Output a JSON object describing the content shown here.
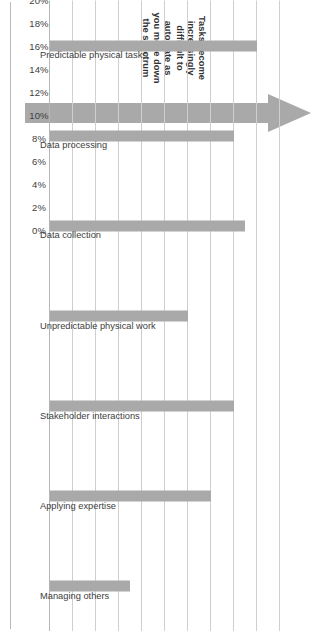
{
  "chart_data": {
    "type": "bar",
    "title": "",
    "subtitle": "",
    "xlabel": "",
    "ylabel": "",
    "orientation": "rotated-90-clockwise",
    "grid": true,
    "legend": null,
    "ylim": [
      0,
      20
    ],
    "y_tick_step": 2,
    "value_suffix": "%",
    "categories": [
      "Predictable physical tasks",
      "Data processing",
      "Data collection",
      "Unpredictable physical work",
      "Stakeholder interactions",
      "Applying expertise",
      "Managing others"
    ],
    "values": [
      18,
      16,
      17,
      12,
      16,
      14,
      7
    ],
    "tick_labels": [
      "0%",
      "2%",
      "4%",
      "6%",
      "8%",
      "10%",
      "12%",
      "14%",
      "16%",
      "18%",
      "20%"
    ],
    "tick_values": [
      0,
      2,
      4,
      6,
      8,
      10,
      12,
      14,
      16,
      18,
      20
    ],
    "annotations": [
      {
        "name": "spectrum-note",
        "lines": [
          "Tasks become",
          "increasingly",
          "difficult to",
          "automate as",
          "you move down",
          "the spectrum"
        ]
      }
    ],
    "colors": {
      "bar": "#a9a9a9",
      "arrow": "#a9a9a9",
      "gridline": "#cfcfcf",
      "axis": "#b5b5b5",
      "text": "#3d3d3d",
      "background": "#ffffff"
    }
  },
  "arrow": {
    "name": "spectrum-arrow",
    "direction": "right",
    "label": ""
  }
}
